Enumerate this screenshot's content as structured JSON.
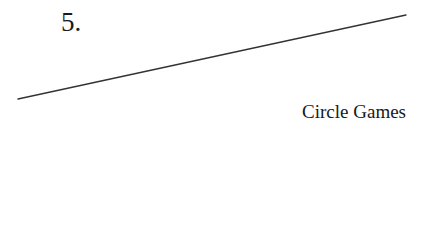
{
  "chapter": {
    "number": "5.",
    "title": "Circle Games"
  },
  "decoration": {
    "rule_color": "#333333"
  }
}
